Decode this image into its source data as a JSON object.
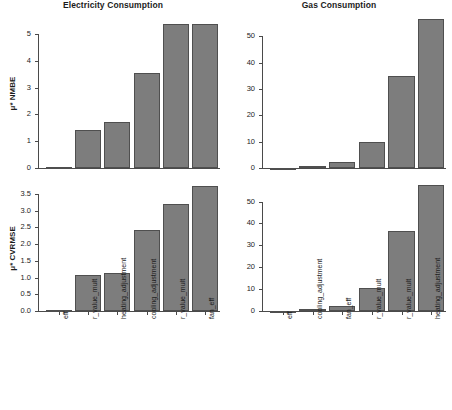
{
  "figure": {
    "width": 452,
    "height": 410,
    "background": "#ffffff",
    "bar_fill": "#7d7d7d",
    "bar_border": "#4f4f4f",
    "axis_color": "#4a4a4a"
  },
  "chart_data": [
    {
      "id": "electricity-nmbe",
      "type": "bar",
      "title": "Electricity Consumption",
      "xlabel": "",
      "ylabel": "μ* NMBE",
      "ylim": [
        0,
        5.6
      ],
      "yticks": [
        0,
        1,
        2,
        3,
        4,
        5
      ],
      "ytick_labels": [
        "0",
        "1",
        "2",
        "3",
        "4",
        "5"
      ],
      "grid": false,
      "legend": "none",
      "categories": [
        "eff",
        "r_value_mult",
        "heating_adjustment",
        "cooling_adjustment",
        "r_value_mult",
        "fan_eff"
      ],
      "values": [
        0.02,
        1.43,
        1.7,
        3.56,
        5.38,
        5.38
      ]
    },
    {
      "id": "gas-nmbe",
      "type": "bar",
      "title": "Gas Consumption",
      "xlabel": "",
      "ylabel": "",
      "ylim": [
        0,
        57
      ],
      "yticks": [
        0,
        10,
        20,
        30,
        40,
        50
      ],
      "ytick_labels": [
        "0",
        "10",
        "20",
        "30",
        "40",
        "50"
      ],
      "grid": false,
      "legend": "none",
      "categories": [
        "eff",
        "cooling_adjustment",
        "fan_eff",
        "r_value_mult",
        "r_value_mult",
        "heating_adjustment"
      ],
      "values": [
        0.15,
        0.9,
        2.1,
        9.7,
        35.0,
        56.5
      ]
    },
    {
      "id": "electricity-cvrmse",
      "type": "bar",
      "title": "",
      "xlabel": "",
      "ylabel": "μ* CVRMSE",
      "ylim": [
        0,
        3.8
      ],
      "yticks": [
        0.0,
        0.5,
        1.0,
        1.5,
        2.0,
        2.5,
        3.0,
        3.5
      ],
      "ytick_labels": [
        "0.0",
        "0.5",
        "1.0",
        "1.5",
        "2.0",
        "2.5",
        "3.0",
        "3.5"
      ],
      "grid": false,
      "legend": "none",
      "categories": [
        "eff",
        "r_value_mult",
        "heating_adjustment",
        "cooling_adjustment",
        "r_value_mult",
        "fan_eff"
      ],
      "values": [
        0.02,
        1.08,
        1.15,
        2.42,
        3.19,
        3.75
      ]
    },
    {
      "id": "gas-cvrmse",
      "type": "bar",
      "title": "",
      "xlabel": "",
      "ylabel": "",
      "ylim": [
        0,
        58
      ],
      "yticks": [
        0,
        10,
        20,
        30,
        40,
        50
      ],
      "ytick_labels": [
        "0",
        "10",
        "20",
        "30",
        "40",
        "50"
      ],
      "grid": false,
      "legend": "none",
      "categories": [
        "eff",
        "cooling_adjustment",
        "fan_eff",
        "r_value_mult",
        "r_value_mult",
        "heating_adjustment"
      ],
      "values": [
        0.12,
        0.85,
        2.3,
        10.5,
        36.7,
        57.5
      ]
    }
  ]
}
